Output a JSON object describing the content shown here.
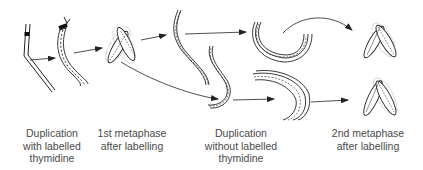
{
  "diagram": {
    "type": "chromosome-labelling-sequence",
    "colors": {
      "stroke": "#222222",
      "label_band": "#111111",
      "halo": "#888888",
      "text": "#4a4a4a"
    },
    "stages": [
      {
        "id": "duplication-with-label",
        "lines": [
          "Duplication",
          "with labelled",
          "thymidine"
        ]
      },
      {
        "id": "first-metaphase",
        "lines": [
          "1st metaphase",
          "after labelling"
        ]
      },
      {
        "id": "duplication-without-label",
        "lines": [
          "Duplication",
          "without labelled",
          "thymidine"
        ]
      },
      {
        "id": "second-metaphase",
        "lines": [
          "2nd metaphase",
          "after labelling"
        ]
      }
    ]
  }
}
